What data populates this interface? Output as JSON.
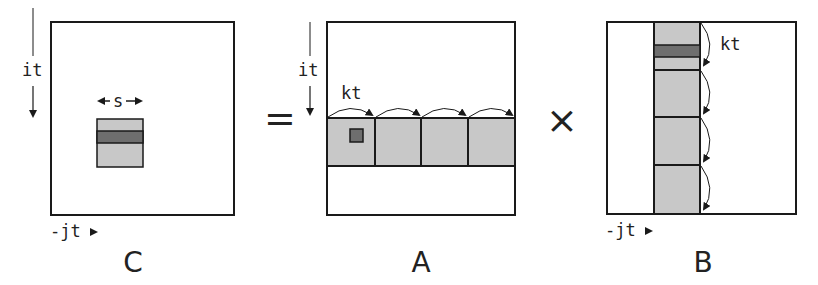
{
  "diagram": {
    "operators": {
      "equals": "=",
      "times": "×"
    },
    "matrices": {
      "C": {
        "label": "C",
        "row_axis": "it",
        "col_axis": "-jt",
        "block_width_label": "s"
      },
      "A": {
        "label": "A",
        "row_axis": "it",
        "step_label": "kt",
        "tiles": 4
      },
      "B": {
        "label": "B",
        "col_axis": "-jt",
        "step_label": "kt",
        "tiles": 4
      }
    },
    "colors": {
      "outline": "#1a1a1a",
      "tile_fill": "#c8c8c8",
      "highlight_fill": "#6e6e6e",
      "background": "#ffffff"
    }
  }
}
